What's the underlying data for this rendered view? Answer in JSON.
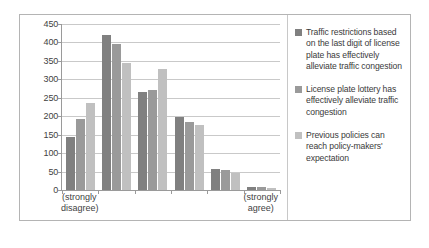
{
  "chart_data": {
    "type": "bar",
    "title": "",
    "xlabel": "",
    "ylabel": "",
    "ylim": [
      0,
      450
    ],
    "yticks": [
      0,
      50,
      100,
      150,
      200,
      250,
      300,
      350,
      400,
      450
    ],
    "grid": true,
    "legend_position": "right",
    "categories": [
      "1",
      "2",
      "3",
      "4",
      "5",
      "6"
    ],
    "category_sublabels": [
      "(strongly disagree)",
      "",
      "",
      "",
      "",
      "(strongly agree)"
    ],
    "series": [
      {
        "name": "Traffic restrictions based on the last digit of license plate has effectively alleviate traffic congestion",
        "color": "#808080",
        "values": [
          145,
          420,
          267,
          197,
          57,
          8
        ]
      },
      {
        "name": "License plate lottery has effectively alleviate traffic congestion",
        "color": "#9a9a9a",
        "values": [
          192,
          395,
          270,
          185,
          55,
          9
        ]
      },
      {
        "name": "Previous policies can reach policy-makers' expectation",
        "color": "#c0c0c0",
        "values": [
          235,
          345,
          328,
          175,
          45,
          6
        ]
      }
    ]
  }
}
